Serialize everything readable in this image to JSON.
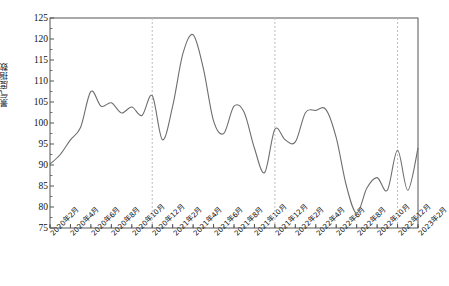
{
  "chart_data": {
    "type": "line",
    "title": "",
    "xlabel": "",
    "ylabel": "景气度指数",
    "ylim": [
      75,
      125
    ],
    "ytick_values": [
      75,
      80,
      85,
      90,
      95,
      100,
      105,
      110,
      115,
      120,
      125
    ],
    "grid": false,
    "legend": "none",
    "line_color": "#6e6e6e",
    "axis_color": "#555555",
    "reference_line_color": "#bdbdbd",
    "reference_line_style": "dashed",
    "reference_lines": [
      "2020年12月",
      "2021年12月",
      "2022年12月"
    ],
    "xtick_labels": [
      "2020年2月",
      "2020年4月",
      "2020年6月",
      "2020年8月",
      "2020年10月",
      "2020年12月",
      "2021年2月",
      "2021年4月",
      "2021年6月",
      "2021年8月",
      "2021年10月",
      "2021年12月",
      "2022年2月",
      "2022年4月",
      "2022年6月",
      "2022年8月",
      "2022年10月",
      "2022年12月",
      "2023年2月"
    ],
    "x": [
      "2020年2月",
      "2020年3月",
      "2020年4月",
      "2020年5月",
      "2020年6月",
      "2020年7月",
      "2020年8月",
      "2020年9月",
      "2020年10月",
      "2020年11月",
      "2020年12月",
      "2021年1月",
      "2021年2月",
      "2021年3月",
      "2021年4月",
      "2021年5月",
      "2021年6月",
      "2021年7月",
      "2021年8月",
      "2021年9月",
      "2021年10月",
      "2021年11月",
      "2021年12月",
      "2022年1月",
      "2022年2月",
      "2022年3月",
      "2022年4月",
      "2022年5月",
      "2022年6月",
      "2022年7月",
      "2022年8月",
      "2022年9月",
      "2022年10月",
      "2022年11月",
      "2022年12月",
      "2023年1月",
      "2023年2月"
    ],
    "values": [
      90.2,
      92.5,
      96.0,
      99.0,
      107.5,
      104.0,
      104.8,
      102.4,
      103.8,
      101.8,
      106.5,
      96.0,
      104.0,
      116.5,
      121.0,
      113.0,
      100.5,
      97.5,
      104.0,
      102.5,
      94.0,
      88.2,
      98.5,
      96.0,
      95.5,
      102.5,
      103.0,
      103.2,
      96.5,
      85.0,
      78.5,
      84.5,
      87.0,
      84.0,
      93.5,
      84.0,
      94.0
    ],
    "series": [
      {
        "name": "景气度指数",
        "color": "#6e6e6e",
        "values": [
          90.2,
          92.5,
          96.0,
          99.0,
          107.5,
          104.0,
          104.8,
          102.4,
          103.8,
          101.8,
          106.5,
          96.0,
          104.0,
          116.5,
          121.0,
          113.0,
          100.5,
          97.5,
          104.0,
          102.5,
          94.0,
          88.2,
          98.5,
          96.0,
          95.5,
          102.5,
          103.0,
          103.2,
          96.5,
          85.0,
          78.5,
          84.5,
          87.0,
          84.0,
          93.5,
          84.0,
          94.0
        ]
      }
    ],
    "annotations": {
      "max_value": 121.0,
      "max_label": "2021年4月",
      "min_value": 78.5,
      "min_label": "2022年8月"
    }
  },
  "caption": {
    "text": ""
  }
}
